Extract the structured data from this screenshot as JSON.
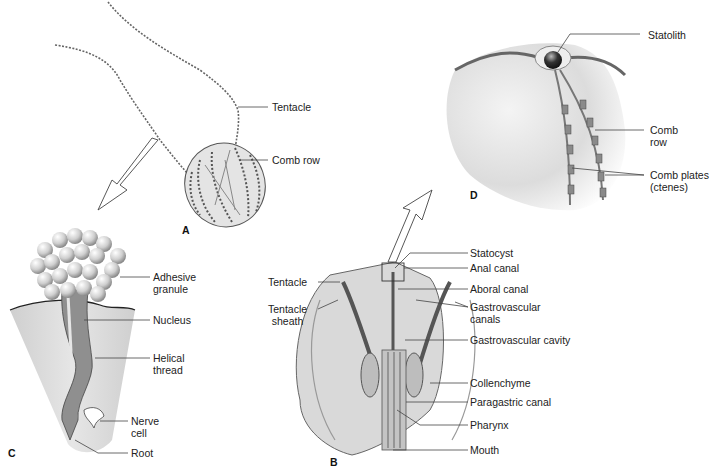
{
  "figure": {
    "panels": {
      "A": {
        "letter": "A",
        "labels": {
          "tentacle": "Tentacle",
          "comb_row": "Comb row"
        }
      },
      "B": {
        "letter": "B",
        "labels": {
          "statocyst": "Statocyst",
          "anal_canal": "Anal canal",
          "aboral_canal": "Aboral canal",
          "gastrovascular_canals_1": "Gastrovascular",
          "gastrovascular_canals_2": "canals",
          "gastrovascular_cavity": "Gastrovascular cavity",
          "collenchyme": "Collenchyme",
          "paragastric_canal": "Paragastric canal",
          "pharynx": "Pharynx",
          "mouth": "Mouth",
          "tentacle": "Tentacle",
          "tentacle_sheath_1": "Tentacle",
          "tentacle_sheath_2": "sheath"
        }
      },
      "C": {
        "letter": "C",
        "labels": {
          "adhesive_granule_1": "Adhesive",
          "adhesive_granule_2": "granule",
          "nucleus": "Nucleus",
          "helical_thread_1": "Helical",
          "helical_thread_2": "thread",
          "nerve_cell_1": "Nerve",
          "nerve_cell_2": "cell",
          "root": "Root"
        }
      },
      "D": {
        "letter": "D",
        "labels": {
          "statolith": "Statolith",
          "comb_row_1": "Comb",
          "comb_row_2": "row",
          "comb_plates_1": "Comb plates",
          "comb_plates_2": "(ctenes)"
        }
      }
    },
    "colors": {
      "background": "#ffffff",
      "body_fill": "#d9d9d9",
      "line": "#333333",
      "text": "#222222"
    }
  }
}
